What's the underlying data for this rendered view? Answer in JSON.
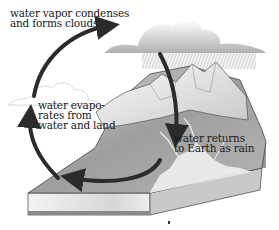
{
  "diagram": {
    "type": "water-cycle",
    "labels": {
      "condense": [
        "water vapor condenses",
        "and forms clouds"
      ],
      "evaporate": [
        "water evapo-",
        "rates from",
        "water and land"
      ],
      "rain": [
        "water returns",
        "to Earth as rain"
      ]
    },
    "colors": {
      "arrow": "#2b2b2b",
      "land_top": "#9a9a9a",
      "land_side": "#dcdcdc",
      "cloud_rain": "#bdbdbd",
      "cloud_outline": "#cfcfcf",
      "mountain": "#eeeeee",
      "water": "#f2f2f2"
    }
  }
}
